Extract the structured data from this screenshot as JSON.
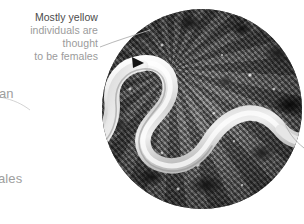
{
  "figure": {
    "type": "annotated-photograph",
    "rendering": "grayscale"
  },
  "callout": {
    "line1": "Mostly yellow",
    "line2": "individuals are thought",
    "line3": "to be females",
    "line1_color": "#4b4b4b",
    "body_color": "#9b9b9b",
    "leader_color": "#b0b0b0"
  },
  "edge_fragments": [
    {
      "id": "fragment-upper",
      "text": "an"
    },
    {
      "id": "fragment-lower",
      "text": "ales"
    }
  ],
  "photo": {
    "shape": "circle",
    "center_x": 202,
    "center_y": 109,
    "radius": 100,
    "substrate_color": "#6a6a6a",
    "organism_color": "#e9e9e9",
    "marker": "arrowhead"
  }
}
